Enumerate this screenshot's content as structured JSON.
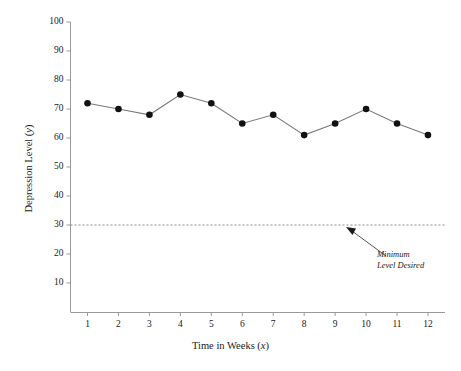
{
  "chart_data": {
    "type": "line",
    "title": "",
    "xlabel": "Time in Weeks (x)",
    "ylabel": "Depression Level (y)",
    "xlabel_text": "Time in Weeks (",
    "xlabel_var": "x",
    "xlabel_tail": ")",
    "ylabel_text": "Depression Level (",
    "ylabel_var": "y",
    "ylabel_tail": ")",
    "x": [
      1,
      2,
      3,
      4,
      5,
      6,
      7,
      8,
      9,
      10,
      11,
      12
    ],
    "values": [
      72,
      70,
      68,
      75,
      72,
      65,
      68,
      61,
      65,
      70,
      65,
      61
    ],
    "categories": [
      "1",
      "2",
      "3",
      "4",
      "5",
      "6",
      "7",
      "8",
      "9",
      "10",
      "11",
      "12"
    ],
    "xticklabels": [
      "1",
      "2",
      "3",
      "4",
      "5",
      "6",
      "7",
      "8",
      "9",
      "10",
      "11",
      "12"
    ],
    "yticklabels": [
      "100",
      "90",
      "80",
      "70",
      "60",
      "50",
      "40",
      "30",
      "20",
      "10"
    ],
    "yticks": [
      100,
      90,
      80,
      70,
      60,
      50,
      40,
      30,
      20,
      10
    ],
    "xlim": [
      0.45,
      12.55
    ],
    "ylim": [
      0,
      100
    ],
    "grid": false,
    "legend": false,
    "marker": "filled-circle",
    "line_color": "#7a7a7a",
    "marker_color": "#111111",
    "axis_color": "#9a9a9a",
    "threshold": {
      "value": 30,
      "style": "dashed",
      "color": "#8c8c8c",
      "label_line1": "Minimum",
      "label_line2": "Level Desired"
    },
    "annotation": {
      "text_line1": "Minimum",
      "text_line2": "Level Desired",
      "arrow_from": [
        386,
        256
      ],
      "arrow_to": [
        347,
        228
      ]
    }
  },
  "annotations": {
    "minimum_line1": "Minimum",
    "minimum_line2": "Level Desired"
  }
}
